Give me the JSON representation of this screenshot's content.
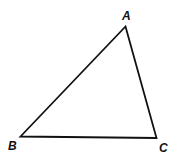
{
  "diagram": {
    "type": "triangle",
    "stroke_color": "#111111",
    "background": "#ffffff",
    "vertices": [
      {
        "label": "A",
        "x": 125.5,
        "y": 26.5,
        "label_x": 122,
        "label_y": 20
      },
      {
        "label": "B",
        "x": 20.5,
        "y": 136.5,
        "label_x": 8,
        "label_y": 150
      },
      {
        "label": "C",
        "x": 156.5,
        "y": 138,
        "label_x": 159,
        "label_y": 152
      }
    ],
    "edges": [
      {
        "from": "A",
        "to": "B"
      },
      {
        "from": "B",
        "to": "C"
      },
      {
        "from": "C",
        "to": "A"
      }
    ]
  }
}
